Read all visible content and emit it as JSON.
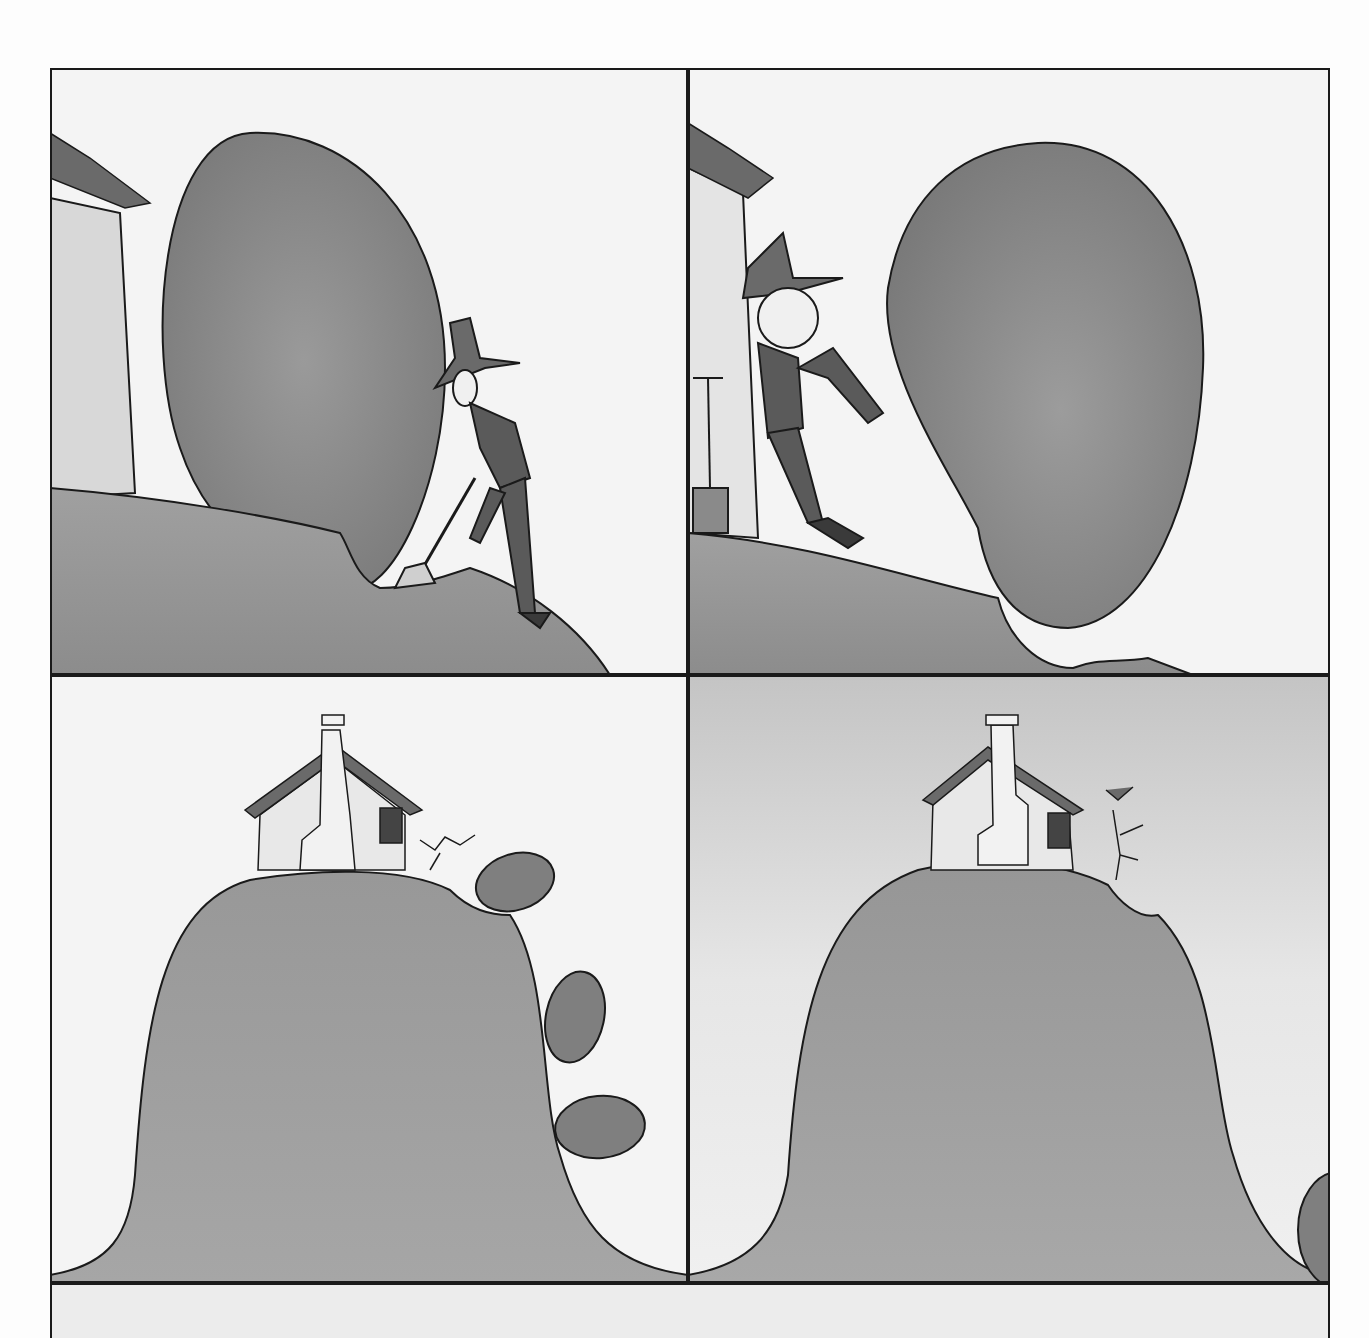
{
  "comic": {
    "panel_count": 5,
    "panels": [
      {
        "index": 1,
        "scene": "farmer-digging-under-boulder",
        "caption": ""
      },
      {
        "index": 2,
        "scene": "farmer-kicking-boulder",
        "caption": ""
      },
      {
        "index": 3,
        "scene": "boulder-rolling-down-hill",
        "caption": ""
      },
      {
        "index": 4,
        "scene": "farmer-celebrating-on-hilltop",
        "caption": ""
      },
      {
        "index": 5,
        "scene": "blank-partial-panel",
        "caption": ""
      }
    ]
  },
  "colors": {
    "ink": "#1a1a1a",
    "boulder": "#8a8a8a",
    "hill": "#9a9a9a",
    "sky": "#f2f2f2",
    "house_wall": "#e8e8e8"
  }
}
